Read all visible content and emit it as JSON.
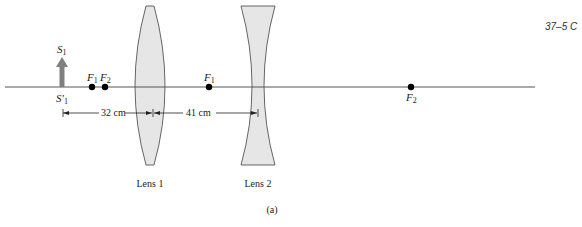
{
  "figure": {
    "id_label": "37–5 C",
    "caption": "(a)"
  },
  "object": {
    "label_top": "S",
    "label_top_sub": "1",
    "label_bottom": "S′",
    "label_bottom_sub": "1"
  },
  "lens1": {
    "label": "Lens 1",
    "type": "converging",
    "focal_left": {
      "letter": "F",
      "sub": "1"
    },
    "focal_right": {
      "letter": "F",
      "sub": "2"
    }
  },
  "lens2": {
    "label": "Lens 2",
    "type": "diverging",
    "focal_left": {
      "letter": "F",
      "sub": "1"
    },
    "focal_right": {
      "letter": "F",
      "sub": "2"
    }
  },
  "dimensions": {
    "object_to_lens1": "32 cm",
    "lens1_to_lens2": "41 cm"
  },
  "colors": {
    "axis": "#555555",
    "lens_fill": "#e6e6e6",
    "lens_stroke": "#555555",
    "arrow": "#808080",
    "dot": "#000000"
  }
}
